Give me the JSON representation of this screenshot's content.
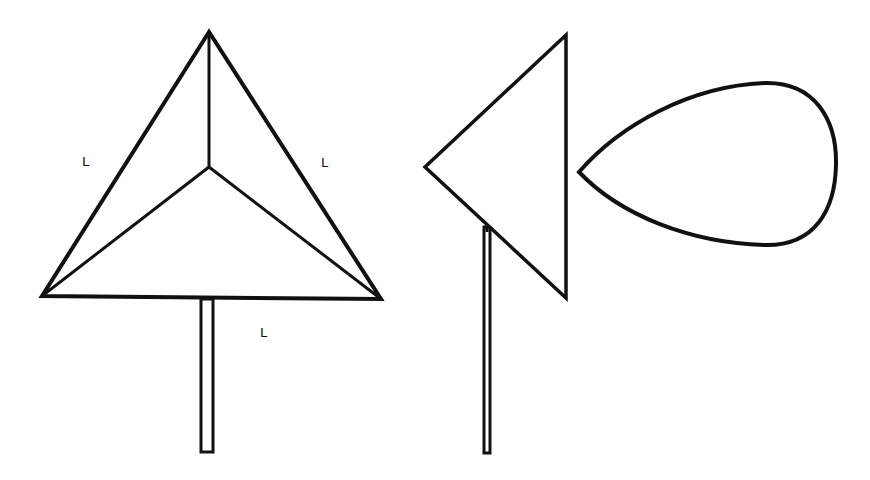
{
  "figure": {
    "labels": [
      "L",
      "L",
      "L"
    ],
    "colors": {
      "stroke": "#111111",
      "background": "#ffffff"
    },
    "shapes": [
      {
        "name": "triangle-sign-front",
        "kind": "equilateral triangle with center point joined to vertices",
        "edge_labels": [
          "L",
          "L",
          "L"
        ]
      },
      {
        "name": "triangle-sign-front-post",
        "kind": "post"
      },
      {
        "name": "triangle-sign-side",
        "kind": "left-pointing triangle"
      },
      {
        "name": "triangle-sign-side-post",
        "kind": "post"
      },
      {
        "name": "teardrop-shape",
        "kind": "left-pointing teardrop outline"
      }
    ]
  }
}
